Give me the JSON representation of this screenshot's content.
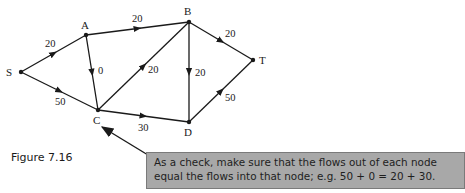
{
  "figure": {
    "caption": "Figure 7.16",
    "nodes": [
      {
        "id": "S",
        "label": "S",
        "x": 21,
        "y": 72,
        "lx": 6,
        "ly": 76
      },
      {
        "id": "A",
        "label": "A",
        "x": 86,
        "y": 35,
        "lx": 81,
        "ly": 29
      },
      {
        "id": "B",
        "label": "B",
        "x": 189,
        "y": 22,
        "lx": 184,
        "ly": 15
      },
      {
        "id": "T",
        "label": "T",
        "x": 253,
        "y": 60,
        "lx": 259,
        "ly": 64
      },
      {
        "id": "C",
        "label": "C",
        "x": 98,
        "y": 110,
        "lx": 93,
        "ly": 124
      },
      {
        "id": "D",
        "label": "D",
        "x": 189,
        "y": 122,
        "lx": 184,
        "ly": 136
      }
    ],
    "edges": [
      {
        "from": "S",
        "to": "A",
        "flow": "20",
        "lx": 45,
        "ly": 47
      },
      {
        "from": "S",
        "to": "C",
        "flow": "50",
        "lx": 55,
        "ly": 105
      },
      {
        "from": "A",
        "to": "B",
        "flow": "20",
        "lx": 132,
        "ly": 22
      },
      {
        "from": "A",
        "to": "C",
        "flow": "0",
        "lx": 98,
        "ly": 74
      },
      {
        "from": "C",
        "to": "B",
        "flow": "20",
        "lx": 148,
        "ly": 73
      },
      {
        "from": "B",
        "to": "D",
        "flow": "20",
        "lx": 195,
        "ly": 76
      },
      {
        "from": "B",
        "to": "T",
        "flow": "20",
        "lx": 225,
        "ly": 37
      },
      {
        "from": "C",
        "to": "D",
        "flow": "30",
        "lx": 138,
        "ly": 131
      },
      {
        "from": "D",
        "to": "T",
        "flow": "50",
        "lx": 225,
        "ly": 101
      }
    ]
  },
  "note": {
    "lines": [
      "As a check, make sure that the flows out of each node",
      "equal the flows into that node; e.g. 50 + 0 = 20 + 30."
    ],
    "pointer_target": "C",
    "background": "#a8a8a8",
    "border": "#7a7a7a"
  }
}
